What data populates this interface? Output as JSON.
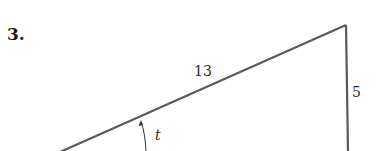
{
  "problem": {
    "number_label": "3."
  },
  "diagram": {
    "type": "right-triangle",
    "hypotenuse_label": "13",
    "vertical_side_label": "5",
    "angle_label": "t",
    "line_color": "#5a5a5a"
  }
}
